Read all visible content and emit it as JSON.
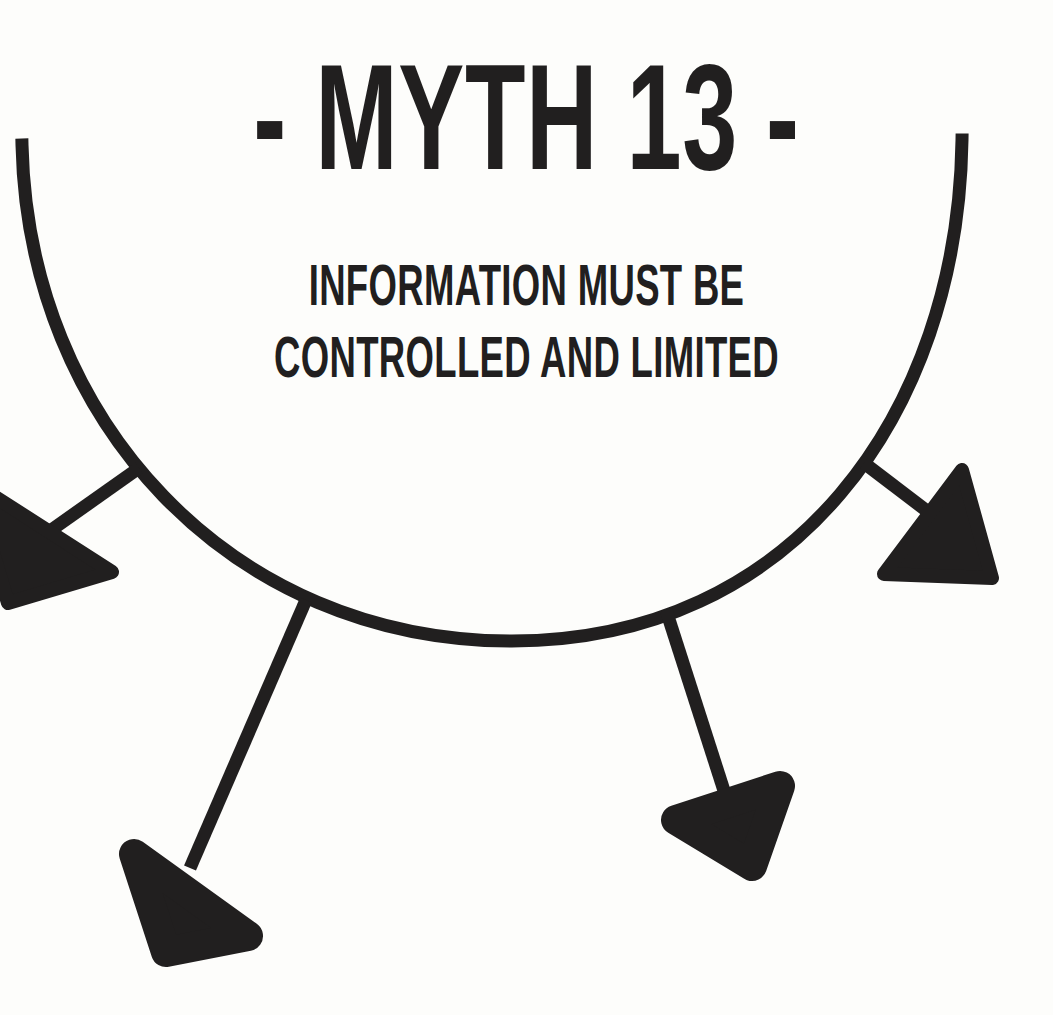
{
  "poster": {
    "background_color": "#fdfdfb",
    "ink_color": "#211f1f",
    "width": 1053,
    "height": 1015,
    "title": "- MYTH 13 -",
    "myth_number": "13",
    "subtitle_line_1": "INFORMATION MUST BE",
    "subtitle_line_2": "CONTROLLED AND LIMITED",
    "subtitle_full": "INFORMATION MUST BE CONTROLLED AND LIMITED"
  },
  "artwork": {
    "description": "downward-opening arc with four arrows branching outward and downward",
    "stroke_color": "#211f1f",
    "stroke_width": 12,
    "arc": {
      "left_end": [
        22,
        145
      ],
      "right_end": [
        962,
        140
      ],
      "bottom": [
        512,
        641
      ]
    },
    "arrows": [
      {
        "name": "arrow-upper-left",
        "direction": "down-left",
        "branch_from": [
          135,
          470
        ],
        "tip": [
          -18,
          560
        ]
      },
      {
        "name": "arrow-upper-right",
        "direction": "down-right",
        "branch_from": [
          866,
          464
        ],
        "tip": [
          995,
          562
        ]
      },
      {
        "name": "arrow-lower-left",
        "direction": "down-left",
        "branch_from": [
          305,
          601
        ],
        "tip": [
          128,
          905
        ]
      },
      {
        "name": "arrow-lower-right",
        "direction": "down-left",
        "branch_from": [
          666,
          611
        ],
        "tip": [
          660,
          822
        ]
      }
    ]
  }
}
